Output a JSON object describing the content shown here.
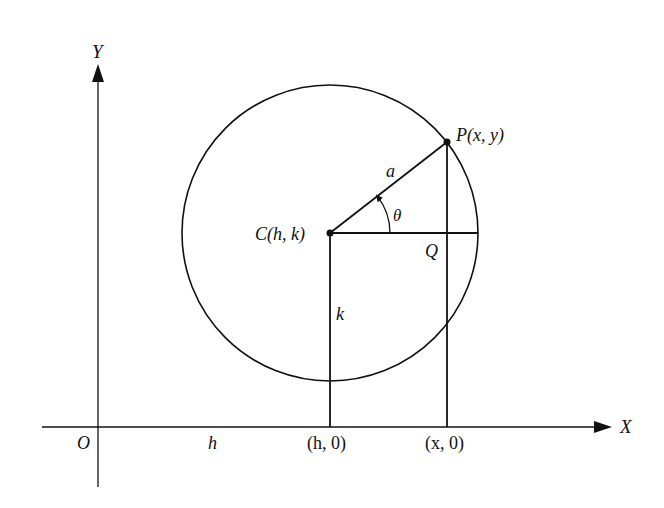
{
  "figure": {
    "colors": {
      "ink": "#111111",
      "background": "#ffffff"
    }
  },
  "axes": {
    "x_label": "X",
    "y_label": "Y",
    "origin_label": "O"
  },
  "labels": {
    "center": "C(h, k)",
    "point": "P(x, y)",
    "radius": "a",
    "angle": "θ",
    "foot": "Q",
    "k_segment": "k",
    "h_segment": "h",
    "h_tick": "(h, 0)",
    "x_tick": "(x, 0)"
  }
}
